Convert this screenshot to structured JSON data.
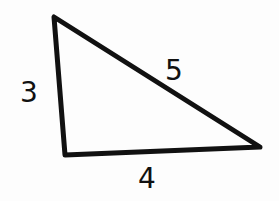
{
  "diagram": {
    "type": "right-triangle",
    "labels": {
      "left_side": "3",
      "hypotenuse": "5",
      "bottom_side": "4"
    },
    "colors": {
      "stroke": "#111111",
      "background": "#fdfdfd"
    }
  }
}
